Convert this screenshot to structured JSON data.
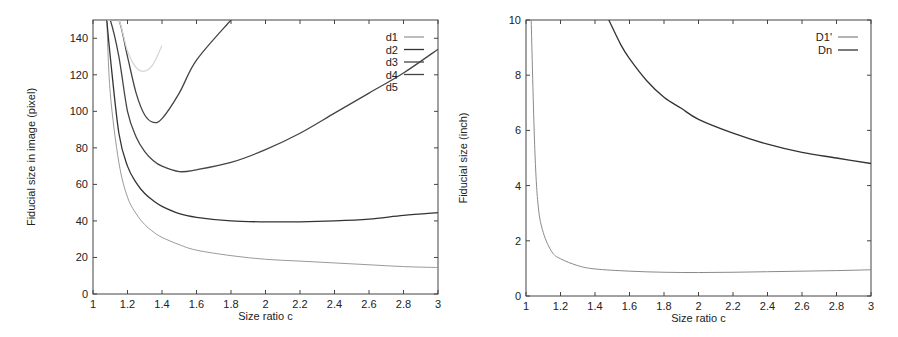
{
  "chart_data": [
    {
      "type": "line",
      "title": "",
      "xlabel": "Size ratio c",
      "ylabel": "Fiducial size in image (pixel)",
      "xlim": [
        1,
        3
      ],
      "ylim": [
        0,
        150
      ],
      "xticks": [
        "1",
        "1.2",
        "1.4",
        "1.6",
        "1.8",
        "2",
        "2.2",
        "2.4",
        "2.6",
        "2.8",
        "3"
      ],
      "yticks": [
        "0",
        "20",
        "40",
        "60",
        "80",
        "100",
        "120",
        "140"
      ],
      "grid": false,
      "legend_position": "upper right",
      "x": [
        1.08,
        1.1,
        1.15,
        1.2,
        1.25,
        1.3,
        1.35,
        1.4,
        1.5,
        1.6,
        1.8,
        2.0,
        2.2,
        2.4,
        2.6,
        2.8,
        3.0
      ],
      "series": [
        {
          "name": "d1",
          "color": "#9a9a9a",
          "values": [
            150,
            110,
            72,
            53,
            44,
            38,
            34,
            31,
            27,
            24,
            21,
            19,
            18,
            17,
            16,
            15,
            14.5
          ]
        },
        {
          "name": "d2",
          "color": "#333333",
          "values": [
            150,
            130,
            88,
            70,
            61,
            55,
            51,
            48,
            44,
            42,
            40,
            39.5,
            39.5,
            40,
            41,
            43,
            44.5
          ]
        },
        {
          "name": "d3",
          "color": "#444444",
          "values": [
            150,
            150,
            130,
            100,
            86,
            78,
            73,
            70,
            67,
            68,
            72,
            79,
            88,
            99,
            110,
            121,
            134
          ]
        },
        {
          "name": "d4",
          "color": "#444444",
          "values": [
            150,
            150,
            150,
            130,
            110,
            98,
            94,
            96,
            110,
            128,
            150,
            null,
            null,
            null,
            null,
            null,
            null
          ]
        },
        {
          "name": "d5",
          "color": "#d8d8d8",
          "values": [
            150,
            150,
            150,
            133,
            124,
            122,
            126,
            136,
            null,
            null,
            null,
            null,
            null,
            null,
            null,
            null,
            null
          ]
        }
      ]
    },
    {
      "type": "line",
      "title": "",
      "xlabel": "Size ratio c",
      "ylabel": "Fiducial size (inch)",
      "xlim": [
        1,
        3
      ],
      "ylim": [
        0,
        10
      ],
      "xticks": [
        "1",
        "1.2",
        "1.4",
        "1.6",
        "1.8",
        "2",
        "2.2",
        "2.4",
        "2.6",
        "2.8",
        "3"
      ],
      "yticks": [
        "0",
        "2",
        "4",
        "6",
        "8",
        "10"
      ],
      "grid": false,
      "legend_position": "upper right",
      "series": [
        {
          "name": "D1'",
          "color": "#8a8a8a",
          "x": [
            1.03,
            1.05,
            1.07,
            1.1,
            1.15,
            1.2,
            1.3,
            1.4,
            1.6,
            1.8,
            2.0,
            2.2,
            2.4,
            2.6,
            2.8,
            3.0
          ],
          "values": [
            10,
            5.5,
            3.3,
            2.3,
            1.6,
            1.35,
            1.1,
            0.98,
            0.9,
            0.86,
            0.85,
            0.86,
            0.88,
            0.9,
            0.92,
            0.95
          ]
        },
        {
          "name": "Dn",
          "color": "#333333",
          "x": [
            1.48,
            1.55,
            1.6,
            1.7,
            1.8,
            1.9,
            2.0,
            2.2,
            2.4,
            2.6,
            2.8,
            3.0
          ],
          "values": [
            10,
            9.1,
            8.6,
            7.8,
            7.2,
            6.8,
            6.4,
            5.9,
            5.5,
            5.2,
            5.0,
            4.8
          ]
        }
      ]
    }
  ]
}
